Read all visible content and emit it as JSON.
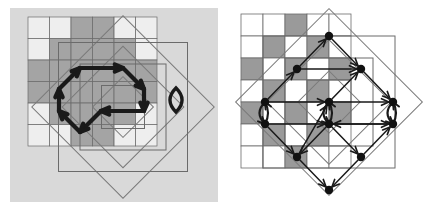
{
  "figure": {
    "panel_count": 2,
    "canvas": {
      "width": 429,
      "height": 213
    },
    "colors": {
      "page_background": "#ffffff",
      "left_panel_background": "#d9d9d9",
      "right_panel_background": "#ffffff",
      "dark_cell": "#9a9a9a",
      "light_cell": "#ffffff",
      "cell_border": "#6b6b6b",
      "diamond_outline": "#7a7a7a",
      "arrow_stroke": "#1a1a1a",
      "node_fill": "#111111"
    }
  },
  "panels": [
    {
      "id": "left",
      "name": "left-panel",
      "label": "",
      "background": "#d9d9d9",
      "bounds": {
        "x": 10,
        "y": 8,
        "width": 208,
        "height": 194
      },
      "description": "Checkerboard diamond lattice with a thick directed hexagonal cycle overlay and one small self-loop at the right vertex",
      "cell_size": 21.5,
      "grid_origin": {
        "x": 28,
        "y": 17
      },
      "shaded_cells": [
        [
          2,
          0
        ],
        [
          3,
          0
        ],
        [
          1,
          1
        ],
        [
          2,
          1
        ],
        [
          3,
          1
        ],
        [
          4,
          1
        ],
        [
          0,
          2
        ],
        [
          1,
          2
        ],
        [
          2,
          2
        ],
        [
          3,
          2
        ],
        [
          4,
          2
        ],
        [
          5,
          2
        ],
        [
          0,
          3
        ],
        [
          1,
          3
        ],
        [
          2,
          3
        ],
        [
          3,
          3
        ],
        [
          4,
          3
        ],
        [
          5,
          3
        ],
        [
          1,
          4
        ],
        [
          2,
          4
        ],
        [
          3,
          4
        ],
        [
          4,
          4
        ],
        [
          2,
          5
        ],
        [
          3,
          5
        ]
      ],
      "checker_parity": "sum-even cells are dark",
      "rotated_squares": [
        {
          "cx": 123.0,
          "cy": 107.0,
          "half": 64.5,
          "rotation_deg": 45
        },
        {
          "cx": 123.0,
          "cy": 107.0,
          "half": 43.0,
          "rotation_deg": 45
        },
        {
          "cx": 123.0,
          "cy": 107.0,
          "half": 21.5,
          "rotation_deg": 45
        }
      ],
      "cycle": {
        "type": "directed-cycle",
        "stroke_width": 4.2,
        "vertices": [
          {
            "x": 59,
            "y": 89
          },
          {
            "x": 80,
            "y": 68
          },
          {
            "x": 123,
            "y": 68
          },
          {
            "x": 144,
            "y": 89
          },
          {
            "x": 144,
            "y": 111
          },
          {
            "x": 101,
            "y": 111
          },
          {
            "x": 80,
            "y": 132
          },
          {
            "x": 59,
            "y": 111
          }
        ],
        "directed_edges": [
          {
            "from": [
              59,
              111
            ],
            "to": [
              59,
              89
            ],
            "arrow": "up"
          },
          {
            "from": [
              59,
              89
            ],
            "to": [
              80,
              68
            ],
            "arrow": "up-right"
          },
          {
            "from": [
              80,
              68
            ],
            "to": [
              123,
              68
            ],
            "arrow": "right"
          },
          {
            "from": [
              123,
              68
            ],
            "to": [
              144,
              89
            ],
            "arrow": "down-right"
          },
          {
            "from": [
              144,
              89
            ],
            "to": [
              144,
              111
            ],
            "arrow": "down"
          },
          {
            "from": [
              144,
              111
            ],
            "to": [
              101,
              111
            ],
            "arrow": "left"
          },
          {
            "from": [
              101,
              111
            ],
            "to": [
              80,
              132
            ],
            "arrow": "down-left"
          },
          {
            "from": [
              80,
              132
            ],
            "to": [
              59,
              111
            ],
            "arrow": "up-left"
          }
        ],
        "self_loop": {
          "cx": 176,
          "cy": 100,
          "rx": 5.5,
          "ry": 12,
          "shape": "lens"
        }
      }
    },
    {
      "id": "right",
      "name": "right-panel",
      "label": "",
      "background": "#ffffff",
      "bounds": {
        "x": 225,
        "y": 6,
        "width": 200,
        "height": 200
      },
      "description": "Same checkerboard diamond lattice shown with nine graph nodes, straight directed arrows along lattice diagonals and horizontals, plus three curved return loops",
      "cell_size": 22,
      "grid_origin": {
        "x": 241,
        "y": 14
      },
      "shaded_cells": [
        [
          2,
          0
        ],
        [
          1,
          1
        ],
        [
          3,
          1
        ],
        [
          0,
          2
        ],
        [
          2,
          2
        ],
        [
          4,
          2
        ],
        [
          1,
          3
        ],
        [
          3,
          3
        ],
        [
          0,
          4
        ],
        [
          2,
          4
        ],
        [
          4,
          4
        ],
        [
          1,
          5
        ],
        [
          3,
          5
        ],
        [
          2,
          6
        ]
      ],
      "rotated_squares": [
        {
          "cx": 329.0,
          "cy": 102.0,
          "half": 66.0,
          "rotation_deg": 45
        },
        {
          "cx": 329.0,
          "cy": 102.0,
          "half": 44.0,
          "rotation_deg": 45
        },
        {
          "cx": 329.0,
          "cy": 102.0,
          "half": 22.0,
          "rotation_deg": 45
        }
      ],
      "nodes": [
        {
          "id": "n-top",
          "x": 329,
          "y": 36
        },
        {
          "id": "n-upper-left",
          "x": 297,
          "y": 69
        },
        {
          "id": "n-upper-right",
          "x": 361,
          "y": 69
        },
        {
          "id": "n-left",
          "x": 265,
          "y": 102
        },
        {
          "id": "n-center-upper",
          "x": 329,
          "y": 102
        },
        {
          "id": "n-right",
          "x": 393,
          "y": 102
        },
        {
          "id": "n-mid-left",
          "x": 265,
          "y": 124
        },
        {
          "id": "n-center-lower",
          "x": 329,
          "y": 124
        },
        {
          "id": "n-mid-right",
          "x": 393,
          "y": 124
        },
        {
          "id": "n-lower-left",
          "x": 297,
          "y": 157
        },
        {
          "id": "n-lower-right",
          "x": 361,
          "y": 157
        },
        {
          "id": "n-bottom",
          "x": 329,
          "y": 190
        }
      ],
      "node_radius": 4.2,
      "directed_edges": [
        {
          "from": "n-upper-left",
          "to": "n-top",
          "arrow": "up-right"
        },
        {
          "from": "n-left",
          "to": "n-upper-left",
          "arrow": "up-right"
        },
        {
          "from": "n-upper-left",
          "to": "n-upper-right",
          "arrow": "right"
        },
        {
          "from": "n-top",
          "to": "n-upper-right",
          "arrow": "down-right"
        },
        {
          "from": "n-center-upper",
          "to": "n-upper-right",
          "arrow": "up-right"
        },
        {
          "from": "n-left",
          "to": "n-center-upper",
          "arrow": "right"
        },
        {
          "from": "n-lower-left",
          "to": "n-center-upper",
          "arrow": "up-right"
        },
        {
          "from": "n-center-upper",
          "to": "n-right",
          "arrow": "right"
        },
        {
          "from": "n-upper-right",
          "to": "n-right",
          "arrow": "down-right"
        },
        {
          "from": "n-mid-left",
          "to": "n-center-lower",
          "arrow": "right"
        },
        {
          "from": "n-center-lower",
          "to": "n-lower-left",
          "arrow": "down-left"
        },
        {
          "from": "n-center-lower",
          "to": "n-lower-right",
          "arrow": "down-right"
        },
        {
          "from": "n-mid-right",
          "to": "n-center-lower",
          "arrow": "left"
        },
        {
          "from": "n-lower-left",
          "to": "n-bottom",
          "arrow": "down-right"
        },
        {
          "from": "n-lower-right",
          "to": "n-bottom",
          "arrow": "down-left"
        },
        {
          "from": "n-lower-right",
          "to": "n-mid-right",
          "arrow": "up-right"
        },
        {
          "from": "n-mid-left",
          "to": "n-lower-left",
          "arrow": "down-right"
        },
        {
          "from": "n-center-lower",
          "to": "n-mid-right",
          "arrow": "right"
        }
      ],
      "return_loops": [
        {
          "id": "loop-left",
          "from": "n-left",
          "to": "n-mid-left",
          "bulge": -11
        },
        {
          "id": "loop-center",
          "from": "n-center-upper",
          "to": "n-center-lower",
          "bulge": -11
        },
        {
          "id": "loop-right",
          "from": "n-right",
          "to": "n-mid-right",
          "bulge": -11
        }
      ]
    }
  ]
}
